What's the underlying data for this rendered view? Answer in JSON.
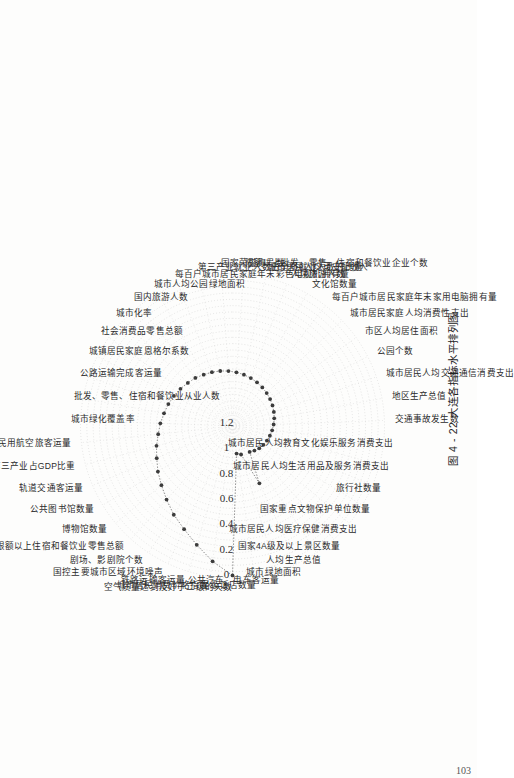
{
  "page": {
    "folio": "103",
    "background_color": "#fdfdfc",
    "orientation_note": "figure printed rotated 90 degrees counter-clockwise"
  },
  "caption": {
    "figure_number": "图 4 - 22",
    "title": "大连各指标水平排列图",
    "full": "图 4 - 22  大连各指标水平排列图"
  },
  "chart_data": {
    "type": "line",
    "radar": true,
    "title": "大连各指标水平排列图",
    "xlabel": "",
    "ylabel": "",
    "grid": true,
    "legend": "none",
    "rlim": [
      0,
      1.2
    ],
    "tick_labels": [
      "0",
      "0.2",
      "0.4",
      "0.6",
      "0.8",
      "1",
      "1.2"
    ],
    "tick_values": [
      0,
      0.2,
      0.4,
      0.6,
      0.8,
      1.0,
      1.2
    ],
    "tick_direction_note": "radial axis increases outward from 0 at rim to 1.2 at center (reversed radial scale as printed)",
    "accent_color": "#3c3c3c",
    "grid_color": "#cfcfcf",
    "categories": [
      "空气质量达到及好于二级的天数",
      "城市居民消费价格指数",
      "铁路运输客运量",
      "国控主要城市区域环境噪声",
      "剧场、影剧院个数",
      "限额以上住宿和餐饮业零售总额",
      "博物馆数量",
      "公共图书馆数量",
      "轨道交通客运量",
      "第三产业占GDP比重",
      "民用航空旅客运量",
      "城市绿化覆盖率",
      "批发、零售、住宿和餐饮业从业人数",
      "公路运输完成客运量",
      "城镇居民家庭恩格尔系数",
      "社会消费品零售总额",
      "城市化率",
      "国内旅游人数",
      "城市人均公园绿地面积",
      "每百户城市居民家庭年末彩色电视机拥有量",
      "第三产业就业人数占全部就业人数的比重",
      "国家荣誉称号数",
      "限额以上批发、零售、住宿和餐饮业企业个数",
      "城市居民人均可支配收入",
      "人境旅游人数",
      "文化馆数量",
      "每百户城市居民家庭年末家用电脑拥有量",
      "城市居民家庭人均消费性支出",
      "市区人均居住面积",
      "公园个数",
      "城市居民人均交通通信消费支出",
      "地区生产总值",
      "交通事故发生数",
      "城市居民人均教育文化娱乐服务消费支出",
      "城市居民人均生活用品及服务消费支出",
      "旅行社数量",
      "国家重点文物保护单位数量",
      "城市居民人均医疗保健消费支出",
      "国家4A级及以上景区数量",
      "人均生产总值",
      "城市绿地面积",
      "公共汽车、电车客运量",
      "星级饭店数量"
    ],
    "values": [
      0.02,
      0.12,
      0.22,
      0.3,
      0.36,
      0.42,
      0.47,
      0.51,
      0.55,
      0.58,
      0.61,
      0.63,
      0.65,
      0.665,
      0.68,
      0.695,
      0.71,
      0.72,
      0.735,
      0.745,
      0.755,
      0.765,
      0.775,
      0.785,
      0.795,
      0.805,
      0.815,
      0.825,
      0.835,
      0.845,
      0.855,
      0.865,
      0.875,
      0.885,
      0.895,
      0.905,
      0.915,
      0.925,
      0.94,
      0.955,
      0.7,
      0.965,
      0.98
    ],
    "value_note": "values read against the radial ticks; the series forms a single monotonically arranged ranking curve"
  }
}
